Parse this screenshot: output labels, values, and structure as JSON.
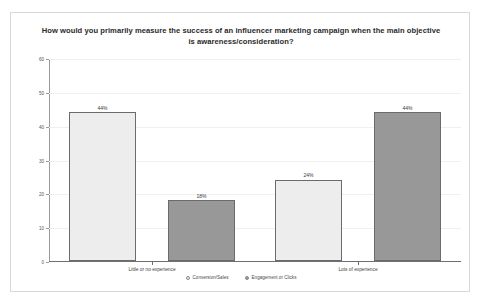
{
  "chart_data": {
    "type": "bar",
    "title": "How would you primarily measure the success of an influencer marketing campaign when the main objective is awareness/consideration?",
    "xlabel": "",
    "ylabel": "",
    "ylim": [
      0,
      60
    ],
    "yticks": [
      0,
      10,
      20,
      30,
      40,
      50,
      60
    ],
    "ytick_labels": [
      "0",
      "10",
      "20",
      "30",
      "40",
      "50",
      "60"
    ],
    "grid": true,
    "legend_position": "bottom",
    "categories": [
      "Little or no experience",
      "Lots of experience"
    ],
    "series": [
      {
        "name": "Conversion/Sales",
        "color": "#ededed",
        "values": [
          44,
          24
        ],
        "data_labels": [
          "44%",
          "24%"
        ]
      },
      {
        "name": "Engagement or Clicks",
        "color": "#989898",
        "values": [
          18,
          44
        ],
        "data_labels": [
          "18%",
          "44%"
        ]
      }
    ]
  }
}
